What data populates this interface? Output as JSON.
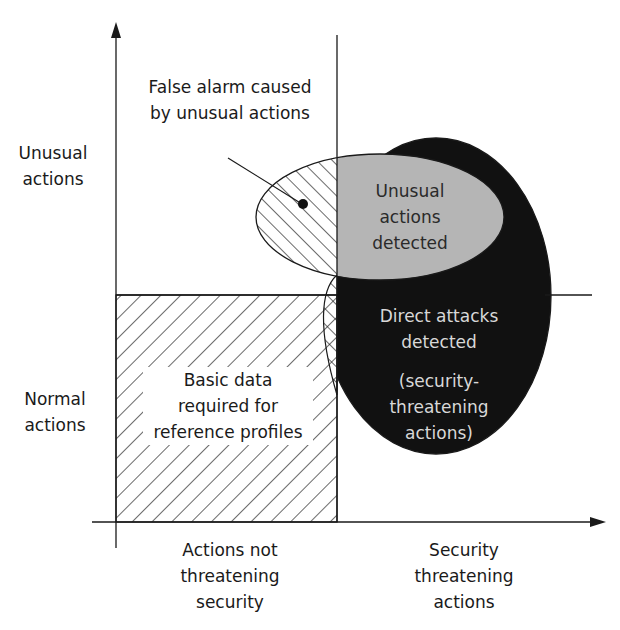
{
  "diagram": {
    "y_axis": {
      "upper_label": "Unusual\nactions",
      "lower_label": "Normal\nactions"
    },
    "x_axis": {
      "left_label": "Actions not\nthreatening\nsecurity",
      "right_label": "Security\nthreatening\nactions"
    },
    "regions": {
      "false_alarm": "False alarm caused\nby unusual actions",
      "unusual_detected": "Unusual\nactions\ndetected",
      "direct_attacks": "Direct attacks\ndetected",
      "direct_attacks_note": "(security-\nthreatening\nactions)",
      "basic_data": "Basic data\nrequired for\nreference profiles"
    },
    "colors": {
      "line": "#1a1a1a",
      "attack_fill": "#111111",
      "unusual_fill": "#b5b5b5",
      "background": "#ffffff"
    }
  }
}
